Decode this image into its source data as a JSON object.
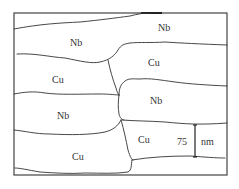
{
  "diagram": {
    "type": "schematic microstructure",
    "colors": {
      "background": "#ffffff",
      "line": "#333333",
      "frame": "#444444",
      "text": "#333333"
    },
    "regions": [
      {
        "id": "r1",
        "label": "Nb"
      },
      {
        "id": "r2",
        "label": "Nb"
      },
      {
        "id": "r3",
        "label": "Cu"
      },
      {
        "id": "r4",
        "label": "Cu"
      },
      {
        "id": "r5",
        "label": "Nb"
      },
      {
        "id": "r6",
        "label": "Nb"
      },
      {
        "id": "r7",
        "label": "Cu"
      },
      {
        "id": "r8",
        "label": "Cu"
      }
    ],
    "scale_bar": {
      "value": "75",
      "unit": "nm"
    }
  }
}
